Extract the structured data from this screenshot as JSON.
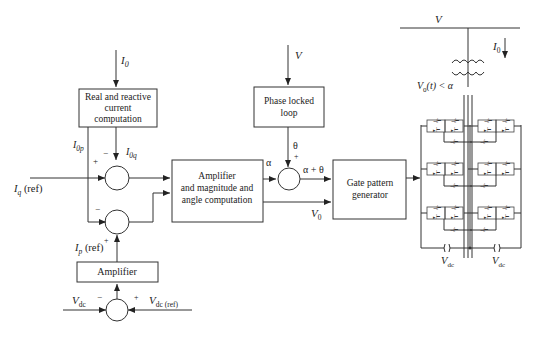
{
  "diagram": {
    "type": "block-diagram",
    "blocks": {
      "current_computation": {
        "lines": [
          "Real and reactive",
          "current",
          "computation"
        ]
      },
      "amplifier_magnitude": {
        "lines": [
          "Amplifier",
          "and magnitude and",
          "angle computation"
        ]
      },
      "pll": {
        "lines": [
          "Phase locked",
          "loop"
        ]
      },
      "gate_pattern": {
        "lines": [
          "Gate pattern",
          "generator"
        ]
      },
      "amplifier": {
        "lines": [
          "Amplifier"
        ]
      }
    },
    "signals": {
      "i0_in": "I",
      "i0_sub": "0",
      "iop": "I",
      "iop_sub": "0p",
      "ioq": "I",
      "ioq_sub": "0q",
      "iq_ref": "I",
      "iq_ref_sub": "q",
      "iq_ref_suffix": " (ref)",
      "ip_ref": "I",
      "ip_ref_sub": "p",
      "ip_ref_suffix": " (ref)",
      "vdc": "V",
      "vdc_sub": "dc",
      "vdc_ref": "V",
      "vdc_ref_sub": "dc (ref)",
      "v_pll": "V",
      "theta": "θ",
      "alpha": "α",
      "alpha_theta": "α + θ",
      "v0": "V",
      "v0_sub": "0",
      "bus_v": "V",
      "i0_bus": "I",
      "i0_bus_sub": "0",
      "v0t": "V",
      "v0t_sub": "0",
      "v0t_rest": "(t) < α",
      "vdc_cap_left": "V",
      "vdc_cap_left_sub": "dc",
      "vdc_cap_right": "V",
      "vdc_cap_right_sub": "dc"
    },
    "signs": {
      "minus": "−",
      "plus": "+"
    }
  }
}
